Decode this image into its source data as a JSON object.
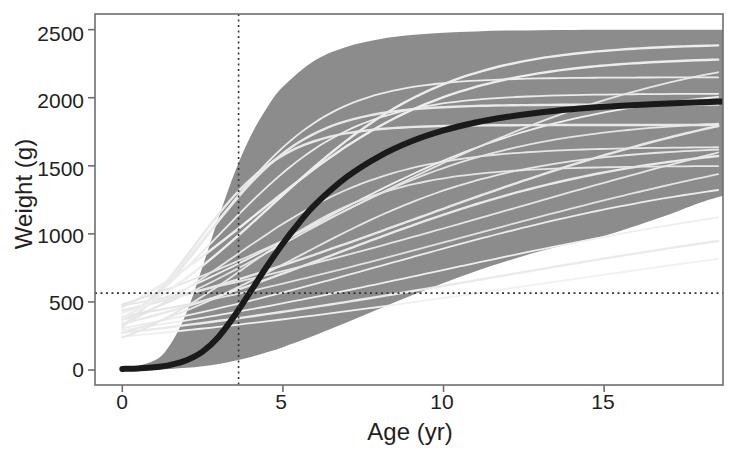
{
  "chart_data": {
    "type": "line",
    "title": "",
    "xlabel": "Age (yr)",
    "ylabel": "Weight (g)",
    "xlim": [
      -0.85,
      18.7
    ],
    "ylim": [
      -110,
      2615
    ],
    "xticks": [
      0,
      5,
      10,
      15
    ],
    "xtick_labels": [
      "0",
      "5",
      "10",
      "15"
    ],
    "yticks": [
      0,
      500,
      1000,
      1500,
      2000,
      2500
    ],
    "ytick_labels": [
      "0",
      "500",
      "1000",
      "1500",
      "2000",
      "2500"
    ],
    "grid": false,
    "legend": null,
    "band": {
      "name": "individual growth curves envelope",
      "color": "#8c8c8c",
      "x": [
        0,
        1,
        1.5,
        2,
        2.5,
        3,
        3.5,
        4,
        4.5,
        5,
        6,
        7,
        8,
        9,
        10,
        11,
        12,
        13,
        14,
        15,
        16,
        17,
        18,
        18.7
      ],
      "upper": [
        5,
        70,
        190,
        420,
        760,
        1120,
        1450,
        1720,
        1925,
        2080,
        2275,
        2375,
        2430,
        2460,
        2478,
        2487,
        2493,
        2496,
        2498,
        2499,
        2500,
        2500,
        2500,
        2500
      ],
      "lower": [
        0,
        3,
        8,
        16,
        28,
        45,
        68,
        96,
        130,
        168,
        255,
        350,
        450,
        548,
        640,
        726,
        803,
        872,
        933,
        987,
        1060,
        1140,
        1230,
        1280
      ]
    },
    "mean_curve": {
      "name": "mean growth curve",
      "color": "#1a1a1a",
      "linewidth": 6,
      "x": [
        0,
        0.5,
        1,
        1.5,
        2,
        2.5,
        3,
        3.5,
        4,
        4.5,
        5,
        5.5,
        6,
        7,
        8,
        9,
        10,
        11,
        12,
        13,
        14,
        15,
        16,
        17,
        18,
        18.7
      ],
      "y": [
        8,
        12,
        20,
        38,
        72,
        135,
        245,
        400,
        580,
        760,
        930,
        1080,
        1215,
        1420,
        1570,
        1680,
        1760,
        1818,
        1860,
        1892,
        1915,
        1933,
        1947,
        1958,
        1967,
        1972
      ]
    },
    "individual_curves": [
      {
        "color": "#e8e8e8",
        "asymptote": 1950,
        "rate": 0.62,
        "inflection": 2.6
      },
      {
        "color": "#ebebeb",
        "asymptote": 2030,
        "rate": 0.48,
        "inflection": 3.1
      },
      {
        "color": "#e6e6e6",
        "asymptote": 1640,
        "rate": 0.4,
        "inflection": 3.4
      },
      {
        "color": "#ededed",
        "asymptote": 2300,
        "rate": 0.33,
        "inflection": 4.2
      },
      {
        "color": "#e4e4e4",
        "asymptote": 1850,
        "rate": 0.28,
        "inflection": 5.0
      },
      {
        "color": "#efefef",
        "asymptote": 2100,
        "rate": 0.24,
        "inflection": 5.8
      },
      {
        "color": "#e9e9e9",
        "asymptote": 1700,
        "rate": 0.21,
        "inflection": 6.6
      },
      {
        "color": "#e5e5e5",
        "asymptote": 2450,
        "rate": 0.19,
        "inflection": 7.4
      },
      {
        "color": "#ececec",
        "asymptote": 1550,
        "rate": 0.17,
        "inflection": 8.2
      },
      {
        "color": "#e7e7e7",
        "asymptote": 2200,
        "rate": 0.155,
        "inflection": 9.0
      },
      {
        "color": "#eeeeee",
        "asymptote": 1450,
        "rate": 0.14,
        "inflection": 9.8
      },
      {
        "color": "#e3e3e3",
        "asymptote": 1950,
        "rate": 0.13,
        "inflection": 10.6
      },
      {
        "color": "#eaeaea",
        "asymptote": 1350,
        "rate": 0.12,
        "inflection": 11.4
      },
      {
        "color": "#e6e6e6",
        "asymptote": 2350,
        "rate": 0.115,
        "inflection": 12.0
      },
      {
        "color": "#f0f0f0",
        "asymptote": 1250,
        "rate": 0.11,
        "inflection": 12.8
      },
      {
        "color": "#e8e8e8",
        "asymptote": 1800,
        "rate": 0.7,
        "inflection": 2.2
      },
      {
        "color": "#ebebeb",
        "asymptote": 2150,
        "rate": 0.55,
        "inflection": 2.9
      },
      {
        "color": "#e5e5e5",
        "asymptote": 1500,
        "rate": 0.44,
        "inflection": 3.8
      },
      {
        "color": "#ededed",
        "asymptote": 2400,
        "rate": 0.36,
        "inflection": 4.6
      },
      {
        "color": "#e7e7e7",
        "asymptote": 1650,
        "rate": 0.3,
        "inflection": 5.4
      }
    ],
    "reference_lines": [
      {
        "name": "age-reference",
        "orientation": "vertical",
        "value": 3.62,
        "style": "dotted",
        "color": "#333333"
      },
      {
        "name": "weight-reference",
        "orientation": "horizontal",
        "value": 565,
        "style": "dotted",
        "color": "#333333"
      }
    ]
  },
  "axes": {
    "frame_color": "#6e6e6e",
    "x_tick_labels": [
      "0",
      "5",
      "10",
      "15"
    ],
    "y_tick_labels": [
      "2500",
      "2000",
      "1500",
      "1000",
      "500",
      "0"
    ],
    "xlabel": "Age (yr)",
    "ylabel": "Weight (g)"
  }
}
